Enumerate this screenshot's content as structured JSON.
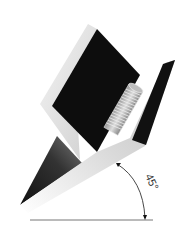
{
  "diagram": {
    "angle_label": "45°",
    "colors": {
      "background": "#ffffff",
      "black_face": "#0d0d0d",
      "light_face": "#e8e8e8",
      "mid_grey": "#a0a0a0",
      "line": "#555555"
    }
  }
}
